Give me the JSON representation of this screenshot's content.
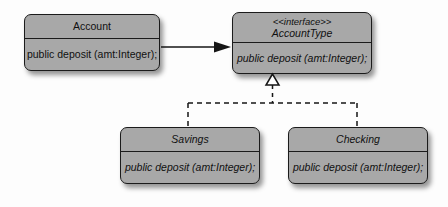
{
  "diagram": {
    "background_color": "#fdfdfd",
    "box_fill_color": "#a8a8a8",
    "box_border_color": "#1b1b1b",
    "line_color": "#161616"
  },
  "classes": {
    "account": {
      "name": "Account",
      "method": "public deposit (amt:Integer);"
    },
    "account_type": {
      "stereotype": "<<interface>>",
      "name": "AccountType",
      "method": "public deposit (amt:Integer);"
    },
    "savings": {
      "name": "Savings",
      "method": "public deposit (amt:Integer);"
    },
    "checking": {
      "name": "Checking",
      "method": "public deposit (amt:Integer);"
    }
  },
  "connectors": {
    "association": {
      "kind": "association-arrow",
      "from": "Account",
      "to": "AccountType",
      "style": "solid",
      "arrowhead": "filled-triangle"
    },
    "realization": {
      "kind": "realization",
      "from": [
        "Savings",
        "Checking"
      ],
      "to": "AccountType",
      "style": "dashed",
      "arrowhead": "hollow-triangle"
    }
  }
}
